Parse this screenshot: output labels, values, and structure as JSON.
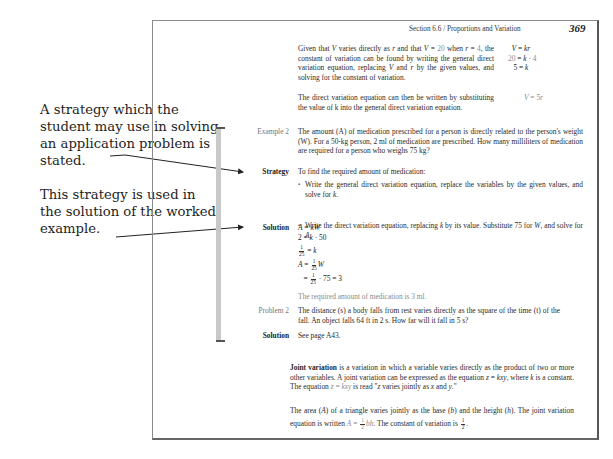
{
  "annotations": [
    {
      "text": "A strategy which the student may use in solving an application problem is stated.",
      "target": "Strategy"
    },
    {
      "text": "This strategy is used in the solution of the worked example.",
      "target": "Solution"
    }
  ],
  "page": {
    "header": "Section 6.6 / Proportions and Variation",
    "page_number": "369",
    "intro": {
      "para1": "Given that V varies directly as r and that V = 20 when r = 4, the constant of variation can be found by writing the general direct variation equation, replacing V and r by the given values, and solving for the constant of variation.",
      "para1_equations": [
        "V = kr",
        "20 = k · 4",
        "5 = k"
      ],
      "para2": "The direct variation equation can then be written by substituting the value of k into the general direct variation equation.",
      "para2_equation": "V = 5r"
    },
    "example": {
      "label": "Example 2",
      "text": "The amount (A) of medication prescribed for a person is directly related to the person's weight (W). For a 50-kg person, 2 ml of medication are prescribed. How many milliliters of medication are required for a person who weighs 75 kg?",
      "strategy_label": "Strategy",
      "strategy_intro": "To find the required amount of medication:",
      "strategy_bullets": [
        "Write the general direct variation equation, replace the variables by the given values, and solve for k.",
        "Write the direct variation equation, replacing k by its value. Substitute 75 for W, and solve for A."
      ],
      "solution_label": "Solution",
      "solution_lines": [
        "A = kW",
        "2 = k · 50",
        "1/25 = k",
        "A = 1/25 W",
        "= 1/25 · 75 = 3"
      ],
      "solution_conclusion": "The required amount of medication is 3 ml."
    },
    "problem": {
      "label": "Problem 2",
      "text": "The distance (s) a body falls from rest varies directly as the square of the time (t) of the fall. An object falls 64 ft in 2 s. How far will it fall in 5 s?",
      "solution_label": "Solution",
      "solution_text": "See page A43."
    },
    "joint": {
      "term": "Joint variation",
      "para1_rest": " is a variation in which a variable varies directly as the product of two or more other variables. A joint variation can be expressed as the equation z = kxy, where k is a constant. The equation z = kxy is read \"z varies jointly as x and y.\"",
      "para2_a": "The area (A) of a triangle varies jointly as the base (b) and the height (h). The joint variation equation is written A = ",
      "para2_b": " bh. The constant of variation is ",
      "para2_c": "."
    }
  }
}
